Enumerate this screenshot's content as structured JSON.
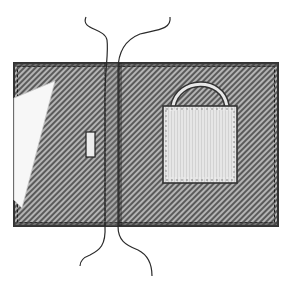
{
  "figure": {
    "colors": {
      "background": "#ffffff",
      "hatch_dark": "#5a5a5a",
      "hatch_light": "#b4b4b4",
      "outline": "#333333",
      "stitch": "#1e1e1e",
      "stitch_light": "#f2f2f2",
      "pocket_fill": "#e6e6e6",
      "pocket_stripe": "#d2d2d2",
      "cutout_fill": "#f7f7f7",
      "thread": "#2a2a2a"
    },
    "components": [
      {
        "name": "wallet-body",
        "label": "Hatched body"
      },
      {
        "name": "fold-seam",
        "label": "Center fold seam"
      },
      {
        "name": "cutout-flap",
        "label": "Triangular cut-out"
      },
      {
        "name": "slot",
        "label": "Small slot"
      },
      {
        "name": "pocket",
        "label": "Bag-shaped pocket"
      },
      {
        "name": "handle",
        "label": "Pocket handle"
      },
      {
        "name": "threads",
        "label": "Threads / cords"
      }
    ]
  }
}
